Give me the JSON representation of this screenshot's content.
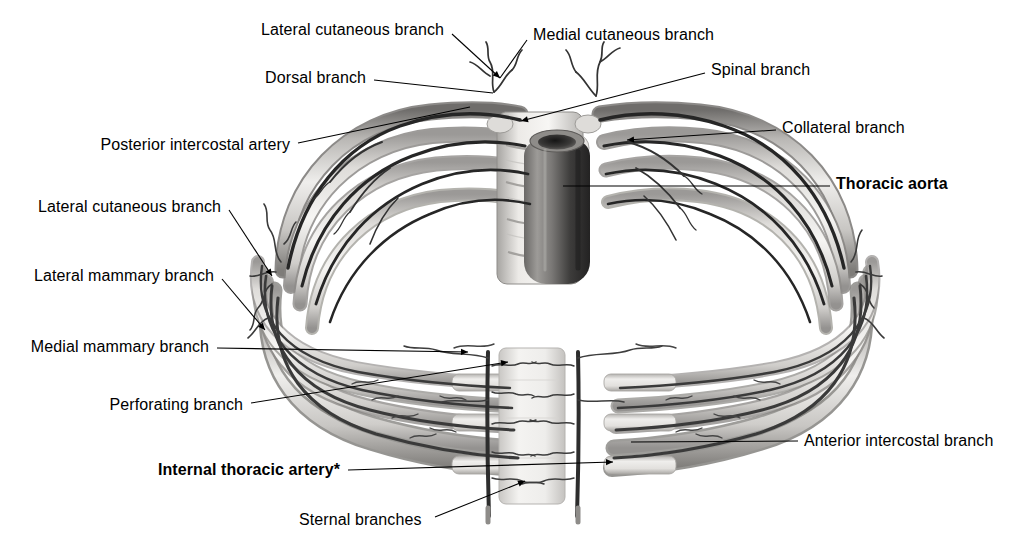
{
  "figure": {
    "width": 1009,
    "height": 545,
    "background_color": "#ffffff",
    "style": "grayscale medical illustration, superior view of thoracic cage"
  },
  "labels": [
    {
      "id": "lateral-cutaneous-branch-top",
      "text": "Lateral cutaneous branch",
      "bold": false,
      "align": "right",
      "x": 444,
      "y": 30,
      "leader": [
        [
          452,
          34
        ],
        [
          500,
          78
        ]
      ],
      "arrow": true
    },
    {
      "id": "medial-cutaneous-branch",
      "text": "Medial cutaneous branch",
      "bold": false,
      "align": "left",
      "x": 533,
      "y": 35,
      "leader": [
        [
          527,
          40
        ],
        [
          500,
          78
        ]
      ],
      "arrow": false
    },
    {
      "id": "dorsal-branch",
      "text": "Dorsal branch",
      "bold": false,
      "align": "right",
      "x": 366,
      "y": 78,
      "leader": [
        [
          374,
          80
        ],
        [
          493,
          93
        ]
      ],
      "arrow": false
    },
    {
      "id": "spinal-branch",
      "text": "Spinal branch",
      "bold": false,
      "align": "left",
      "x": 711,
      "y": 70,
      "leader": [
        [
          705,
          73
        ],
        [
          521,
          121
        ]
      ],
      "arrow": true
    },
    {
      "id": "posterior-intercostal-artery",
      "text": "Posterior intercostal artery",
      "bold": false,
      "align": "right",
      "x": 290,
      "y": 145,
      "leader": [
        [
          298,
          143
        ],
        [
          470,
          107
        ]
      ],
      "arrow": false
    },
    {
      "id": "collateral-branch",
      "text": "Collateral branch",
      "bold": false,
      "align": "left",
      "x": 782,
      "y": 128,
      "leader": [
        [
          776,
          130
        ],
        [
          627,
          140
        ]
      ],
      "arrow": true
    },
    {
      "id": "thoracic-aorta",
      "text": "Thoracic aorta",
      "bold": true,
      "align": "left",
      "x": 836,
      "y": 184,
      "leader": [
        [
          830,
          186
        ],
        [
          563,
          186
        ]
      ],
      "arrow": false
    },
    {
      "id": "lateral-cutaneous-branch-mid",
      "text": "Lateral cutaneous branch",
      "bold": false,
      "align": "right",
      "x": 221,
      "y": 207,
      "leader": [
        [
          229,
          210
        ],
        [
          272,
          276
        ]
      ],
      "arrow": true
    },
    {
      "id": "lateral-mammary-branch",
      "text": "Lateral mammary branch",
      "bold": false,
      "align": "right",
      "x": 214,
      "y": 276,
      "leader": [
        [
          222,
          279
        ],
        [
          265,
          330
        ]
      ],
      "arrow": true
    },
    {
      "id": "medial-mammary-branch",
      "text": "Medial mammary branch",
      "bold": false,
      "align": "right",
      "x": 209,
      "y": 347,
      "leader": [
        [
          217,
          348
        ],
        [
          468,
          352
        ]
      ],
      "arrow": true
    },
    {
      "id": "perforating-branch",
      "text": "Perforating branch",
      "bold": false,
      "align": "right",
      "x": 243,
      "y": 405,
      "leader": [
        [
          251,
          403
        ],
        [
          508,
          362
        ]
      ],
      "arrow": true
    },
    {
      "id": "anterior-intercostal-branch",
      "text": "Anterior intercostal branch",
      "bold": false,
      "align": "left",
      "x": 804,
      "y": 441,
      "leader": [
        [
          798,
          441
        ],
        [
          631,
          442
        ]
      ],
      "arrow": false
    },
    {
      "id": "internal-thoracic-artery",
      "text": "Internal thoracic artery*",
      "bold": true,
      "align": "right",
      "x": 340,
      "y": 470,
      "leader": [
        [
          348,
          470
        ],
        [
          613,
          462
        ]
      ],
      "arrow": true
    },
    {
      "id": "sternal-branches",
      "text": "Sternal branches",
      "bold": false,
      "align": "left",
      "x": 299,
      "y": 520,
      "leader": [
        [
          435,
          517
        ],
        [
          525,
          481
        ]
      ],
      "arrow": true
    }
  ],
  "anatomy": {
    "structures": [
      {
        "name": "thoracic-aorta",
        "type": "vessel-tube",
        "description": "dark cylindrical descending aorta, center, vertical"
      },
      {
        "name": "vertebral-bodies",
        "type": "bone-stack",
        "description": "stacked vertebral bodies behind aorta"
      },
      {
        "name": "sternum",
        "type": "bone",
        "description": "pale vertical sternum at anterior midline"
      },
      {
        "name": "rib-left",
        "type": "bone-arch",
        "description": "left ribs curving anteriorly"
      },
      {
        "name": "rib-right",
        "type": "bone-arch",
        "description": "right ribs curving anteriorly"
      },
      {
        "name": "costal-cartilage",
        "type": "cartilage",
        "description": "pale anterior rib ends joining sternum"
      },
      {
        "name": "posterior-intercostal-artery",
        "type": "artery",
        "description": "dark artery along each rib from aorta"
      },
      {
        "name": "internal-thoracic-artery",
        "type": "artery",
        "description": "vertical artery on each side of sternum"
      }
    ],
    "rib_count_per_side": 5,
    "colors": {
      "bone_light": "#f2f1ef",
      "bone_mid": "#cfcdca",
      "bone_shadow": "#8c8a87",
      "artery_dark": "#2b2b2b",
      "artery_mid": "#5a5a5a",
      "aorta_dark": "#3a3a3a",
      "leader_line": "#000000"
    }
  }
}
